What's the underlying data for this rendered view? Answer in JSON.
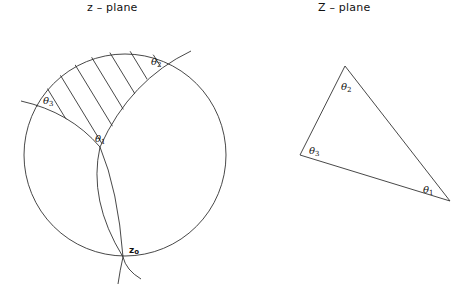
{
  "titles": {
    "left": "z – plane",
    "right": "Z – plane"
  },
  "z_plane": {
    "angle_labels": [
      {
        "symbol": "θ",
        "sub": "1"
      },
      {
        "symbol": "θ",
        "sub": "2"
      },
      {
        "symbol": "θ",
        "sub": "3"
      }
    ],
    "point_label": {
      "symbol": "z",
      "sub": "o"
    }
  },
  "Z_plane": {
    "angle_labels": [
      {
        "symbol": "θ",
        "sub": "1"
      },
      {
        "symbol": "θ",
        "sub": "2"
      },
      {
        "symbol": "θ",
        "sub": "3"
      }
    ]
  }
}
